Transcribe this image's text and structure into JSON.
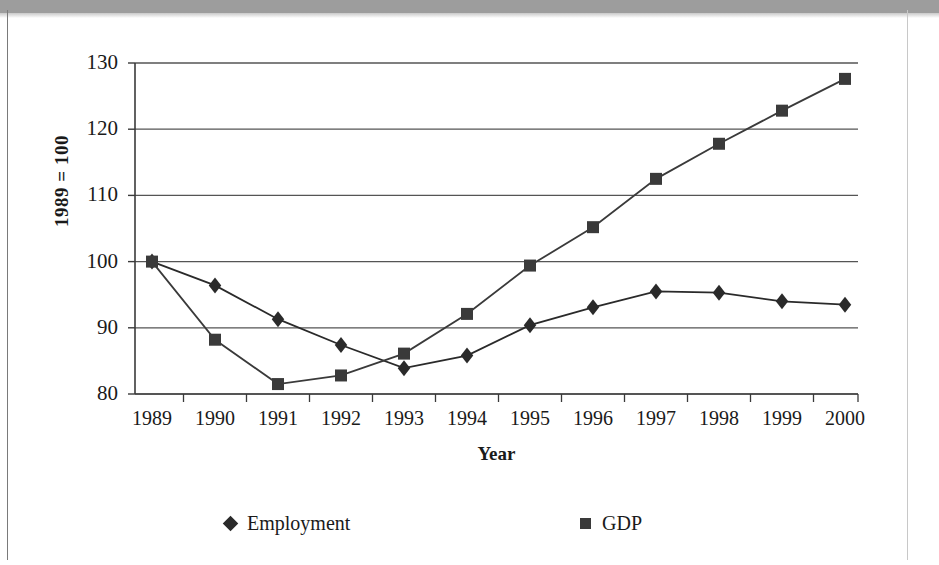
{
  "chart_data": {
    "type": "line",
    "title": "",
    "subtitle": "",
    "xlabel": "Year",
    "ylabel": "1989 = 100",
    "categories": [
      "1989",
      "1990",
      "1991",
      "1992",
      "1993",
      "1994",
      "1995",
      "1996",
      "1997",
      "1998",
      "1999",
      "2000"
    ],
    "ylim": [
      80,
      130
    ],
    "yticks": [
      80,
      90,
      100,
      110,
      120,
      130
    ],
    "ytick_labels": [
      "80",
      "90",
      "100",
      "110",
      "120",
      "130"
    ],
    "xlim_labels": [
      "1989",
      "2000"
    ],
    "grid": "horizontal",
    "legend_position": "bottom",
    "series": [
      {
        "name": "Employment",
        "marker": "diamond",
        "color": "#2a2a2a",
        "values": [
          100.0,
          96.4,
          91.3,
          87.4,
          83.9,
          85.8,
          90.4,
          93.1,
          95.5,
          95.3,
          94.0,
          93.5
        ]
      },
      {
        "name": "GDP",
        "marker": "square",
        "color": "#3a3a3a",
        "values": [
          100.0,
          88.2,
          81.5,
          82.8,
          86.1,
          92.1,
          99.4,
          105.2,
          112.5,
          117.8,
          122.8,
          127.6
        ]
      }
    ]
  },
  "axis": {
    "y_title": "1989 = 100",
    "x_title": "Year"
  },
  "legend": {
    "items": [
      {
        "label": "Employment",
        "marker": "diamond-marker-icon"
      },
      {
        "label": "GDP",
        "marker": "square-marker-icon"
      }
    ]
  }
}
